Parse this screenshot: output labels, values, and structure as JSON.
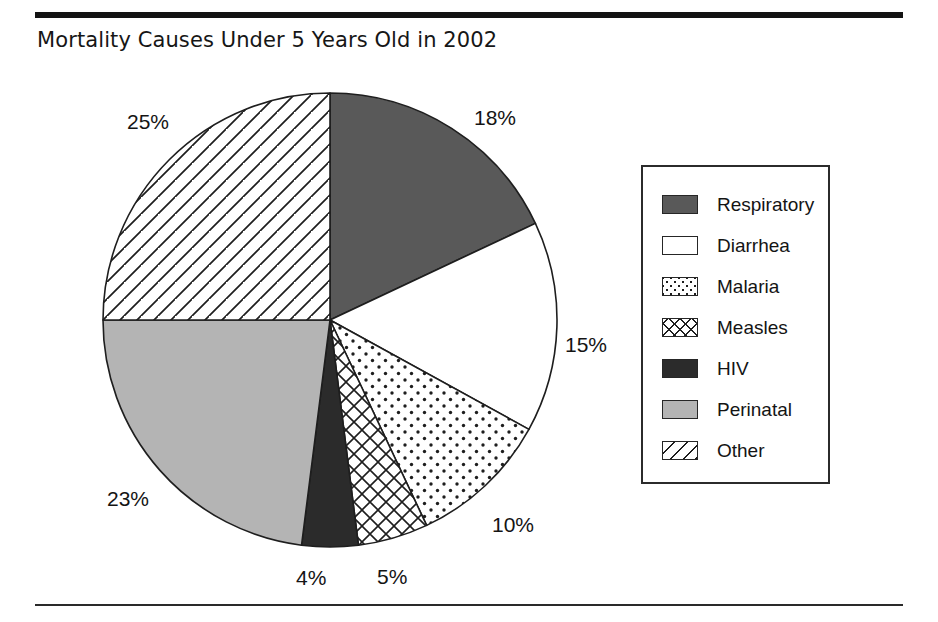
{
  "figure": {
    "title": "Mortality Causes Under 5 Years Old in 2002",
    "rule_color": "#131313"
  },
  "chart_data": {
    "type": "pie",
    "title": "Mortality Causes Under 5 Years Old in 2002",
    "xlabel": "",
    "ylabel": "",
    "unit": "%",
    "start_angle_deg": 0,
    "direction": "clockwise",
    "legend_position": "right",
    "grid": false,
    "categories": [
      "Respiratory",
      "Diarrhea",
      "Malaria",
      "Measles",
      "HIV",
      "Perinatal",
      "Other"
    ],
    "values": [
      18,
      15,
      10,
      5,
      4,
      23,
      25
    ],
    "labels": [
      "18%",
      "15%",
      "10%",
      "5%",
      "4%",
      "23%",
      "25%"
    ],
    "slices": [
      {
        "name": "Respiratory",
        "value": 18,
        "label": "18%",
        "fill": "#595959",
        "pattern": "solid-dark-gray"
      },
      {
        "name": "Diarrhea",
        "value": 15,
        "label": "15%",
        "fill": "#ffffff",
        "pattern": "solid-white"
      },
      {
        "name": "Malaria",
        "value": 10,
        "label": "10%",
        "fill": "#ffffff",
        "pattern": "dots"
      },
      {
        "name": "Measles",
        "value": 5,
        "label": "5%",
        "fill": "#ffffff",
        "pattern": "cross-hatch"
      },
      {
        "name": "HIV",
        "value": 4,
        "label": "4%",
        "fill": "#2b2b2b",
        "pattern": "solid-black"
      },
      {
        "name": "Perinatal",
        "value": 23,
        "label": "23%",
        "fill": "#b4b4b4",
        "pattern": "solid-light-gray"
      },
      {
        "name": "Other",
        "value": 25,
        "label": "25%",
        "fill": "#ffffff",
        "pattern": "diagonal-stripes"
      }
    ]
  },
  "pct_labels": [
    {
      "text": "18%",
      "x": 474,
      "y": 106
    },
    {
      "text": "15%",
      "x": 565,
      "y": 333
    },
    {
      "text": "10%",
      "x": 492,
      "y": 513
    },
    {
      "text": "5%",
      "x": 377,
      "y": 565
    },
    {
      "text": "4%",
      "x": 296,
      "y": 566
    },
    {
      "text": "23%",
      "x": 107,
      "y": 487
    },
    {
      "text": "25%",
      "x": 127,
      "y": 110
    }
  ],
  "legend": {
    "items": [
      {
        "label": "Respiratory",
        "pattern": "solid-dark-gray"
      },
      {
        "label": "Diarrhea",
        "pattern": "solid-white"
      },
      {
        "label": "Malaria",
        "pattern": "dots"
      },
      {
        "label": "Measles",
        "pattern": "cross-hatch"
      },
      {
        "label": "HIV",
        "pattern": "solid-black"
      },
      {
        "label": "Perinatal",
        "pattern": "solid-light-gray"
      },
      {
        "label": "Other",
        "pattern": "diagonal-stripes"
      }
    ]
  }
}
